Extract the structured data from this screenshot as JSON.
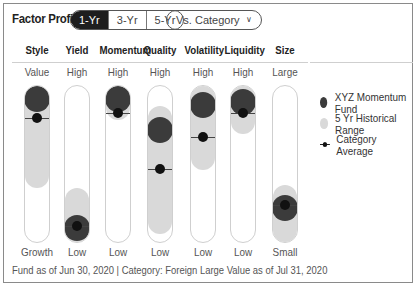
{
  "header": {
    "title": "Factor Profile",
    "periods": [
      "1-Yr",
      "3-Yr",
      "5-Yr"
    ],
    "selected_period": "1-Yr",
    "compare_dropdown": "Vs. Category",
    "compare_icon": "chevron-down-icon"
  },
  "legend": {
    "fund": "XYZ Momentum Fund",
    "range": "5 Yr Historical Range",
    "average": "Category Average"
  },
  "colors": {
    "fund": "#3b3b3b",
    "range": "#d9d9d9",
    "average": "#111111",
    "selected_tab": "#1e1e1e"
  },
  "footer": "Fund as of Jun 30, 2020 | Category: Foreign Large Value as of Jul 31, 2020",
  "chart_data": {
    "type": "range-dot",
    "title": "Factor Profile",
    "scale": "0 = bottom (Low/Growth/Small), 100 = top (High/Value/Large)",
    "categories": [
      "Style",
      "Yield",
      "Momentum",
      "Quality",
      "Volatility",
      "Liquidity",
      "Size"
    ],
    "top_labels": [
      "Value",
      "High",
      "High",
      "High",
      "High",
      "High",
      "Large"
    ],
    "bottom_labels": [
      "Growth",
      "Low",
      "Low",
      "Low",
      "Low",
      "Low",
      "Small"
    ],
    "series": [
      {
        "name": "XYZ Momentum Fund",
        "values": [
          92,
          10,
          92,
          72,
          88,
          90,
          23
        ]
      },
      {
        "name": "Category Average",
        "values": [
          79,
          11,
          82,
          47,
          67,
          82,
          24
        ]
      },
      {
        "name": "5 Yr Historical Range",
        "ranges": [
          [
            35,
            100
          ],
          [
            0,
            35
          ],
          [
            78,
            100
          ],
          [
            6,
            87
          ],
          [
            46,
            100
          ],
          [
            69,
            100
          ],
          [
            0,
            37
          ]
        ]
      }
    ],
    "ylim": [
      0,
      100
    ]
  }
}
